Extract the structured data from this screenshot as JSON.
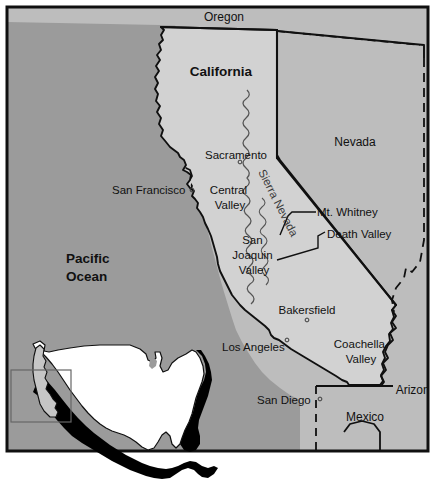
{
  "map": {
    "title": "California reference map",
    "frame": {
      "border_color": "#101010",
      "background": "#ffffff"
    },
    "colors": {
      "ocean": "#9b9b9b",
      "california_fill": "#d2d2d2",
      "nevada_fill": "#bdbdbd",
      "neighbor_fill": "#bdbdbd",
      "outline": "#101010",
      "inset_land": "#ffffff",
      "inset_highlight": "#c6c6c6",
      "inset_shadow": "#000000",
      "range_stroke": "#555555"
    },
    "states": [
      {
        "name": "california",
        "label": "California",
        "style": "state"
      },
      {
        "name": "nevada",
        "label": "Nevada",
        "style": "neighbor"
      },
      {
        "name": "oregon",
        "label": "Oregon",
        "style": "neighbor"
      },
      {
        "name": "arizona",
        "label": "Arizona",
        "style": "neighbor"
      },
      {
        "name": "mexico",
        "label": "Mexico",
        "style": "neighbor"
      }
    ],
    "water": [
      {
        "name": "pacific-ocean",
        "line1": "Pacific",
        "line2": "Ocean"
      }
    ],
    "cities": [
      {
        "name": "sacramento",
        "label": "Sacramento",
        "marker": true
      },
      {
        "name": "san-francisco",
        "label": "San Francisco",
        "marker": true
      },
      {
        "name": "bakersfield",
        "label": "Bakersfield",
        "marker": true
      },
      {
        "name": "los-angeles",
        "label": "Los Angeles",
        "marker": true
      },
      {
        "name": "san-diego",
        "label": "San Diego",
        "marker": true
      }
    ],
    "features": [
      {
        "name": "central-valley",
        "line1": "Central",
        "line2": "Valley"
      },
      {
        "name": "san-joaquin-valley",
        "line1": "San",
        "line2": "Joaquin",
        "line3": "Valley"
      },
      {
        "name": "coachella-valley",
        "line1": "Coachella",
        "line2": "Valley"
      },
      {
        "name": "mt-whitney",
        "label": "Mt. Whitney",
        "leader": true
      },
      {
        "name": "death-valley",
        "label": "Death Valley",
        "leader": true
      },
      {
        "name": "sierra-nevada",
        "label": "Sierra Nevada",
        "rotated": true
      }
    ],
    "inset": {
      "name": "united-states-locator",
      "description": "United States locator inset with California highlighted",
      "highlight_state": "California",
      "box_visible": true
    }
  }
}
